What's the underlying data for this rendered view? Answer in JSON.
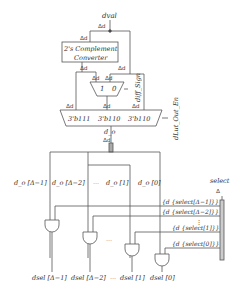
{
  "diagram": {
    "input": {
      "label": "dval",
      "width": "Δd"
    },
    "converter": {
      "line1": "2's Complement",
      "line2": "Converter",
      "in_width": "Δd",
      "out_width": "Δd"
    },
    "bypass_width": "Δd",
    "mux2": {
      "in1": "1",
      "in0": "0",
      "w1": "Δd",
      "w0": "Δd",
      "sel_label": "diff_Sign",
      "sel_width": "1"
    },
    "mux3": {
      "inputs": [
        "3'b111",
        "3'b110",
        "3'b110"
      ],
      "widths": [
        "Δd",
        "Δd",
        "Δd"
      ],
      "sel_label": "dLut_Out_En",
      "sel_width": "3",
      "out_label": "d_o",
      "out_width": "Δd"
    },
    "bits": [
      "d_o [Δ−1]",
      "d_o [Δ−2]",
      "d_o [1]",
      "d_o [0]"
    ],
    "bit_ellipsis": "···",
    "bit_width": "d",
    "select": {
      "label": "select",
      "width": "Δ"
    },
    "select_terms": [
      "{d {select[Δ−1]}}",
      "{d {select[Δ−2]}}",
      "{d {select[1]}}",
      "{d {select[0]}}"
    ],
    "select_vellipsis": "⋮",
    "gate_ellipsis": "···",
    "outputs": [
      "dsel [Δ−1]",
      "dsel [Δ−2]",
      "dsel [1]",
      "dsel [0]"
    ],
    "out_ellipsis": "···",
    "out_width": "d"
  }
}
